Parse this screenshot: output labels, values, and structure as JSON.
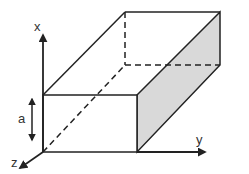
{
  "diagram": {
    "axes": {
      "x_label": "x",
      "y_label": "y",
      "z_label": "z"
    },
    "dimensions": {
      "a_label": "a",
      "b_label": "b",
      "c_label": "c"
    },
    "colors": {
      "stroke": "#222222",
      "shaded_face": "#d9d9d9",
      "background": "#ffffff"
    }
  }
}
